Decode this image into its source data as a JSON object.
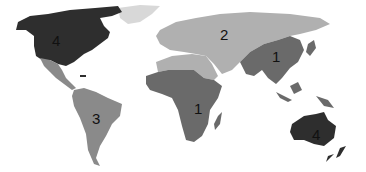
{
  "map": {
    "title": "World map regions",
    "shades": {
      "darkest": "#2e2e2e",
      "dark": "#6a6a6a",
      "medium": "#8a8a8a",
      "light": "#b0b0b0",
      "lightest": "#d8d8d8"
    },
    "regions": [
      {
        "id": "north-america",
        "label": "4",
        "shade": "darkest"
      },
      {
        "id": "greenland",
        "label": "",
        "shade": "lightest"
      },
      {
        "id": "central-america",
        "label": "",
        "shade": "medium"
      },
      {
        "id": "south-america",
        "label": "3",
        "shade": "medium"
      },
      {
        "id": "europe-russia-middle-east",
        "label": "2",
        "shade": "light"
      },
      {
        "id": "north-africa",
        "label": "",
        "shade": "light"
      },
      {
        "id": "sub-saharan-africa",
        "label": "1",
        "shade": "dark"
      },
      {
        "id": "south-east-asia",
        "label": "1",
        "shade": "dark"
      },
      {
        "id": "australia",
        "label": "4",
        "shade": "darkest"
      },
      {
        "id": "new-zealand",
        "label": "",
        "shade": "darkest"
      }
    ]
  }
}
